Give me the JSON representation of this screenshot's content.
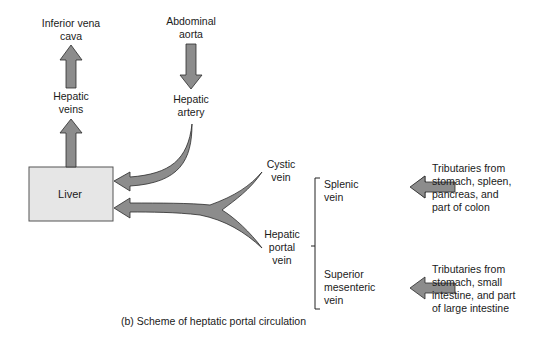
{
  "labels": {
    "inferior_vena_cava": [
      "Inferior vena",
      "cava"
    ],
    "abdominal_aorta": [
      "Abdominal",
      "aorta"
    ],
    "hepatic_veins": [
      "Hepatic",
      "veins"
    ],
    "hepatic_artery": [
      "Hepatic",
      "artery"
    ],
    "liver": "Liver",
    "cystic_vein": [
      "Cystic",
      "vein"
    ],
    "hepatic_portal_vein": [
      "Hepatic",
      "portal",
      "vein"
    ],
    "splenic_vein": [
      "Splenic",
      "vein"
    ],
    "superior_mesenteric_vein": [
      "Superior",
      "mesenteric",
      "vein"
    ],
    "tributaries_splenic": [
      "Tributaries from",
      "stomach, spleen,",
      "pancreas, and",
      "part of colon"
    ],
    "tributaries_mesenteric": [
      "Tributaries from",
      "stomach, small",
      "intestine, and part",
      "of large intestine"
    ]
  },
  "caption": "(b) Scheme of heptatic portal circulation",
  "colors": {
    "arrow_fill": "#8c8c8c",
    "arrow_stroke": "#2b2b2b",
    "liver_fill": "#e6e6e6",
    "liver_stroke": "#555555"
  }
}
